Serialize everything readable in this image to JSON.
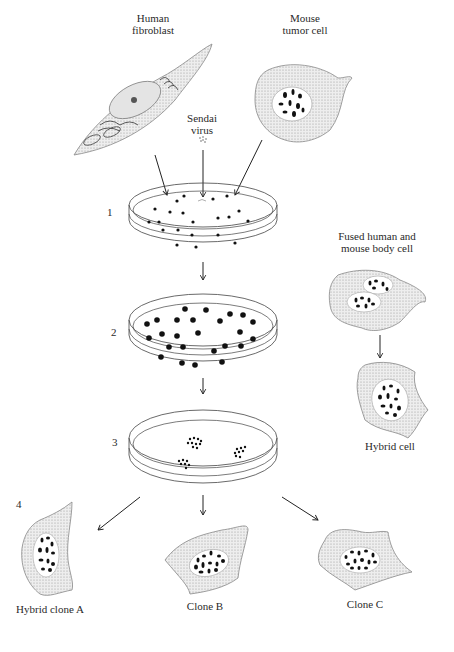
{
  "labels": {
    "human_fibroblast": [
      "Human",
      "fibroblast"
    ],
    "mouse_tumor_cell": [
      "Mouse",
      "tumor cell"
    ],
    "sendai_virus": [
      "Sendai",
      "virus"
    ],
    "fused_cell": [
      "Fused human and",
      "mouse body cell"
    ],
    "hybrid_cell": "Hybrid cell",
    "clone_a": "Hybrid clone A",
    "clone_b": "Clone B",
    "clone_c": "Clone C"
  },
  "steps": [
    "1",
    "2",
    "3",
    "4"
  ],
  "colors": {
    "ink": "#222222",
    "stipple": "#d6d6d6",
    "background": "#ffffff"
  }
}
